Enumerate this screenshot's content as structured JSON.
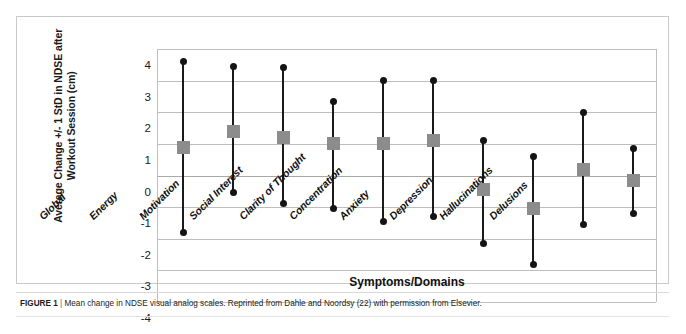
{
  "figure": {
    "caption_label": "FIGURE 1",
    "caption_separator": "|",
    "caption_text": "Mean change in NDSE visual analog scales. Reprinted from Dahle and Noordsy (22) with permission from Elsevier."
  },
  "colors": {
    "marker_gray": "#8c8c8c",
    "line_black": "#1a1a1a",
    "gridline": "#bdbdbd",
    "frame": "#c9c9c9"
  },
  "chart_data": {
    "type": "scatter",
    "title": "",
    "xlabel": "Symptoms/Domains",
    "ylabel": "Average Change +/- 1 StD in NDSE after Workout Session (cm)",
    "ylim": [
      -4,
      4
    ],
    "yticks": [
      4,
      3,
      2,
      1,
      0,
      -1,
      -2,
      -3,
      -4
    ],
    "ytick_labels": [
      "4",
      "3",
      "2",
      "1",
      "0",
      "-1",
      "-2",
      "-3",
      "-4"
    ],
    "grid": "horizontal",
    "legend": "none",
    "error_representation": "mean +/- 1 StD",
    "categories": [
      "Global",
      "Energy",
      "Motivation",
      "Social Interest",
      "Clarity of Thought",
      "Concentration",
      "Anxiety",
      "Depression",
      "Hallucinations",
      "Delusions"
    ],
    "series": [
      {
        "name": "Mean",
        "values": [
          0.9,
          1.4,
          1.2,
          1.0,
          1.0,
          1.1,
          -0.45,
          -1.05,
          0.2,
          -0.15
        ]
      },
      {
        "name": "Upper (+1 StD)",
        "values": [
          3.6,
          3.45,
          3.4,
          2.35,
          3.0,
          3.0,
          1.1,
          0.6,
          2.0,
          0.85
        ]
      },
      {
        "name": "Lower (-1 StD)",
        "values": [
          -1.8,
          -0.55,
          -0.9,
          -1.05,
          -1.45,
          -1.3,
          -2.15,
          -2.8,
          -1.55,
          -1.2
        ]
      }
    ]
  }
}
